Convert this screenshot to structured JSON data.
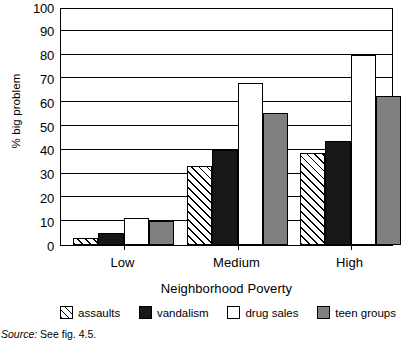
{
  "chart_data": {
    "type": "bar",
    "title": "",
    "xlabel": "Neighborhood Poverty",
    "ylabel": "% big problem",
    "categories": [
      "Low",
      "Medium",
      "High"
    ],
    "ylim": [
      0,
      100
    ],
    "yticks": [
      0,
      10,
      20,
      30,
      40,
      50,
      60,
      70,
      80,
      90,
      100
    ],
    "grid": true,
    "legend_position": "bottom",
    "series": [
      {
        "name": "assaults",
        "values": [
          3,
          33,
          38.5
        ],
        "fill": "diagonal-hatch",
        "color": "#ffffff"
      },
      {
        "name": "vandalism",
        "values": [
          5,
          40,
          43.5
        ],
        "fill": "solid",
        "color": "#171717"
      },
      {
        "name": "drug sales",
        "values": [
          11.5,
          68,
          80
        ],
        "fill": "solid",
        "color": "#ffffff"
      },
      {
        "name": "teen groups",
        "values": [
          10,
          55.5,
          62.5
        ],
        "fill": "solid",
        "color": "#808080"
      }
    ]
  },
  "source_note": {
    "label": "Source:",
    "text": "See fig. 4.5."
  }
}
